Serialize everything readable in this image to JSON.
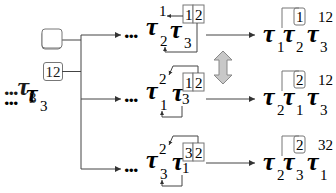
{
  "diagram": {
    "symbol": "τ",
    "ellipsis": "...",
    "root": {
      "ellipsis": "...",
      "sub": "3",
      "sup_boxed": "12"
    },
    "branches": [
      {
        "left": {
          "ellipsis": "...",
          "t1": {
            "sub": "2",
            "sup": "1"
          },
          "t2": {
            "sub": "3",
            "sup_boxed_a": "1",
            "sup_boxed_b": "2"
          }
        },
        "right": {
          "t1": {
            "sub": "1",
            "sup": ""
          },
          "t2": {
            "sub": "2",
            "sup_boxed": "1"
          },
          "t3": {
            "sub": "3",
            "sup": "12"
          }
        }
      },
      {
        "left": {
          "ellipsis": "...",
          "t1": {
            "sub": "1",
            "sup": "2"
          },
          "t2": {
            "sub": "3",
            "sup_boxed_a": "1",
            "sup_boxed_b": "2"
          }
        },
        "right": {
          "t1": {
            "sub": "2",
            "sup": ""
          },
          "t2": {
            "sub": "1",
            "sup_boxed": "2"
          },
          "t3": {
            "sub": "3",
            "sup": "12"
          }
        }
      },
      {
        "left": {
          "ellipsis": "...",
          "t1": {
            "sub": "3",
            "sup": "2"
          },
          "t2": {
            "sub": "1",
            "sup_boxed_a": "3",
            "sup_boxed_b": "2"
          }
        },
        "right": {
          "t1": {
            "sub": "2",
            "sup": ""
          },
          "t2": {
            "sub": "3",
            "sup_boxed": "2"
          },
          "t3": {
            "sub": "1",
            "sup": "32"
          }
        }
      }
    ],
    "equivalence_arrow": {
      "icon": "double-vertical-arrow-icon",
      "fill": "#c8c8c8",
      "stroke": "#888888"
    },
    "colors": {
      "line": "#444444",
      "box": "#777777",
      "text": "#1a1a1a"
    }
  }
}
